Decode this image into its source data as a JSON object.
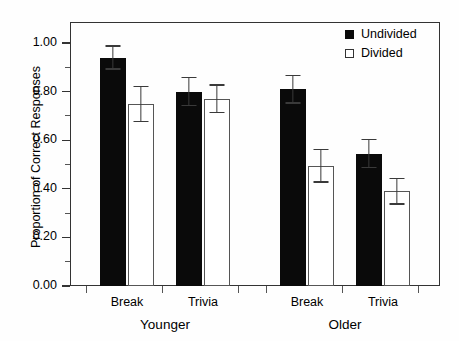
{
  "chart_data": {
    "type": "bar",
    "title": "",
    "xlabel": "",
    "ylabel": "Proportion of Correct Responses",
    "ylim": [
      0.0,
      1.0
    ],
    "ytick_labels": [
      "0.00",
      "0.20",
      "0.40",
      "0.60",
      "0.80",
      "1.00"
    ],
    "ytick_values": [
      0.0,
      0.2,
      0.4,
      0.6,
      0.8,
      1.0
    ],
    "minor_ticks": true,
    "grid": false,
    "legend_position": "top-right",
    "group_labels": [
      "Younger",
      "Older"
    ],
    "categories": [
      "Break",
      "Trivia",
      "Break",
      "Trivia"
    ],
    "series": [
      {
        "name": "Undivided",
        "style": "filled",
        "color": "#0a0a0a",
        "values": [
          0.94,
          0.8,
          0.81,
          0.545
        ],
        "errors": [
          0.05,
          0.06,
          0.06,
          0.06
        ]
      },
      {
        "name": "Divided",
        "style": "open",
        "color": "#ffffff",
        "values": [
          0.75,
          0.77,
          0.495,
          0.39
        ],
        "errors": [
          0.075,
          0.06,
          0.07,
          0.055
        ]
      }
    ]
  },
  "legend": {
    "items": [
      {
        "label": "Undivided",
        "swatch": "filled-square-icon"
      },
      {
        "label": "Divided",
        "swatch": "open-square-icon"
      }
    ]
  },
  "axis": {
    "y_title": "Proportion of Correct Responses"
  }
}
